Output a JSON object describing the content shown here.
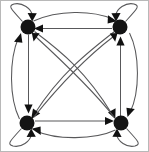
{
  "figure": {
    "type": "diagram",
    "diagram_kind": "directed-graph",
    "width": 149,
    "height": 152,
    "background_color": "#ffffff",
    "border_color": "#b8b8b8",
    "node_color": "#141414",
    "edge_color": "#58585a",
    "arrow_color": "#111111",
    "node_radius": 7.5,
    "node_count": 4,
    "edge_count": 12,
    "loop_count": 4
  },
  "graph": {
    "nodes": [
      {
        "id": "n1",
        "name": "top-left-node",
        "cx": 28,
        "cy": 27,
        "r": 7.5,
        "label": ""
      },
      {
        "id": "n2",
        "name": "top-right-node",
        "cx": 120,
        "cy": 27,
        "r": 7.5,
        "label": ""
      },
      {
        "id": "n3",
        "name": "bottom-left-node",
        "cx": 27,
        "cy": 123,
        "r": 7.5,
        "label": ""
      },
      {
        "id": "n4",
        "name": "bottom-right-node",
        "cx": 121,
        "cy": 123,
        "r": 7.5,
        "label": ""
      }
    ],
    "edges": [
      {
        "id": "e1",
        "name": "edge-top-left-to-top-right",
        "from": "n1",
        "to": "n2",
        "style": "curved-arc",
        "bow": "above",
        "directed": true
      },
      {
        "id": "e2",
        "name": "edge-top-right-to-top-left",
        "from": "n2",
        "to": "n1",
        "style": "straight",
        "bow": "none",
        "directed": true
      },
      {
        "id": "e3",
        "name": "edge-bottom-left-to-bottom-right",
        "from": "n3",
        "to": "n4",
        "style": "straight",
        "bow": "none",
        "directed": true
      },
      {
        "id": "e4",
        "name": "edge-bottom-right-to-bottom-left",
        "from": "n4",
        "to": "n3",
        "style": "curved-arc",
        "bow": "below",
        "directed": true
      },
      {
        "id": "e5",
        "name": "edge-top-left-to-bottom-left",
        "from": "n1",
        "to": "n3",
        "style": "straight",
        "bow": "none",
        "directed": true
      },
      {
        "id": "e6",
        "name": "edge-bottom-left-to-top-left",
        "from": "n3",
        "to": "n1",
        "style": "curved-arc",
        "bow": "left",
        "directed": true
      },
      {
        "id": "e7",
        "name": "edge-bottom-right-to-top-right",
        "from": "n4",
        "to": "n2",
        "style": "straight",
        "bow": "none",
        "directed": true
      },
      {
        "id": "e8",
        "name": "edge-top-right-to-bottom-right",
        "from": "n2",
        "to": "n4",
        "style": "curved-arc",
        "bow": "right",
        "directed": true
      },
      {
        "id": "e9",
        "name": "edge-top-left-to-bottom-right",
        "from": "n1",
        "to": "n4",
        "style": "curved-arc",
        "bow": "clockwise",
        "directed": true
      },
      {
        "id": "e10",
        "name": "edge-bottom-right-to-top-left",
        "from": "n4",
        "to": "n1",
        "style": "curved-arc",
        "bow": "clockwise",
        "directed": true
      },
      {
        "id": "e11",
        "name": "edge-top-right-to-bottom-left",
        "from": "n2",
        "to": "n3",
        "style": "curved-arc",
        "bow": "clockwise",
        "directed": true
      },
      {
        "id": "e12",
        "name": "edge-bottom-left-to-top-right",
        "from": "n3",
        "to": "n2",
        "style": "curved-arc",
        "bow": "clockwise",
        "directed": true
      }
    ],
    "self_loops": [
      {
        "id": "l1",
        "name": "self-loop-top-left",
        "node": "n1",
        "side": "upper-left",
        "arrow_direction": "down"
      },
      {
        "id": "l2",
        "name": "self-loop-top-right",
        "node": "n2",
        "side": "upper-right",
        "arrow_direction": "down"
      },
      {
        "id": "l3",
        "name": "self-loop-bottom-left",
        "node": "n3",
        "side": "lower-left",
        "arrow_direction": "up"
      },
      {
        "id": "l4",
        "name": "self-loop-bottom-right",
        "node": "n4",
        "side": "lower-right",
        "arrow_direction": "up"
      }
    ]
  }
}
